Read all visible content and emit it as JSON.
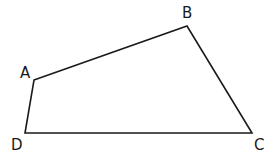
{
  "diagram": {
    "type": "quadrilateral",
    "vertices": [
      {
        "label": "A",
        "x": 34,
        "y": 80,
        "lx": 27,
        "ly": 78
      },
      {
        "label": "B",
        "x": 187,
        "y": 26,
        "lx": 187,
        "ly": 18
      },
      {
        "label": "C",
        "x": 252,
        "y": 133,
        "lx": 259,
        "ly": 150
      },
      {
        "label": "D",
        "x": 25,
        "y": 133,
        "lx": 17,
        "ly": 150
      }
    ],
    "edges": [
      "AB",
      "BC",
      "CD",
      "DA"
    ],
    "stroke_color": "#1a1a1a"
  }
}
